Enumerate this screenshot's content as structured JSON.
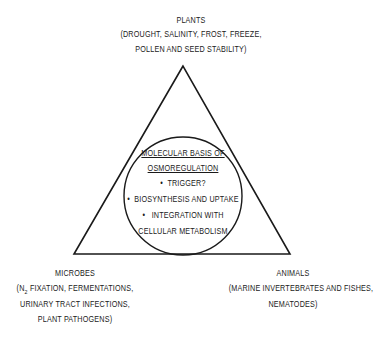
{
  "diagram": {
    "type": "triangle-with-inscribed-circle",
    "plants": {
      "title": "PLANTS",
      "line1": "(DROUGHT, SALINITY, FROST, FREEZE,",
      "line2": "POLLEN AND SEED STABILITY)"
    },
    "microbes": {
      "title": "MICROBES",
      "line1_pre": "(N",
      "line1_sub": "2",
      "line1_post": " FIXATION, FERMENTATIONS,",
      "line2": "URINARY TRACT INFECTIONS,",
      "line3": "PLANT PATHOGENS)"
    },
    "animals": {
      "title": "ANIMALS",
      "line1": "(MARINE INVERTEBRATES AND FISHES,",
      "line2": "NEMATODES)"
    },
    "center": {
      "heading1": "MOLECULAR BASIS OF",
      "heading2": "OSMOREGULATION",
      "bullet": "•",
      "item1": "TRIGGER?",
      "item2": "BIOSYNTHESIS AND UPTAKE",
      "item3a": "INTEGRATION WITH",
      "item3b": "CELLULAR METABOLISM"
    }
  }
}
